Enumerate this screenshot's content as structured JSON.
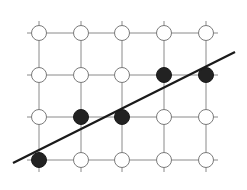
{
  "diagram": {
    "type": "line-rasterization-grid",
    "grid": {
      "columns": 5,
      "rows": 4,
      "x_positions": [
        39,
        81,
        122,
        164,
        206
      ],
      "y_positions": [
        33,
        75,
        117,
        160
      ],
      "stub_length": 12,
      "line_color": "#8a8a8a"
    },
    "pixel_radius": 7.5,
    "colors": {
      "empty_fill": "#ffffff",
      "empty_stroke": "#7a7a7a",
      "filled_fill": "#222222",
      "filled_stroke": "#1a1a1a",
      "ideal_line": "#1a1a1a"
    },
    "filled_pixels": [
      {
        "col": 0,
        "row": 3
      },
      {
        "col": 1,
        "row": 2
      },
      {
        "col": 2,
        "row": 2
      },
      {
        "col": 3,
        "row": 1
      },
      {
        "col": 4,
        "row": 1
      }
    ],
    "ideal_line": {
      "x1": 13,
      "y1": 163,
      "x2": 235,
      "y2": 52,
      "width": 2.2
    }
  }
}
